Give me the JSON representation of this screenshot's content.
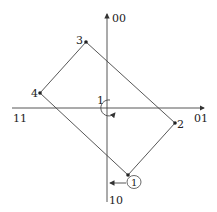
{
  "diagram": {
    "type": "constellation-rotation",
    "axes": {
      "top_label": "00",
      "right_label": "01",
      "left_label": "11",
      "bottom_label": "10"
    },
    "points": [
      {
        "id": "1",
        "label": "1",
        "circled": true
      },
      {
        "id": "2",
        "label": "2",
        "circled": false
      },
      {
        "id": "3",
        "label": "3",
        "circled": false
      },
      {
        "id": "4",
        "label": "4",
        "circled": false
      }
    ],
    "rotation_label": "1",
    "colors": {
      "line": "#444444",
      "text": "#222222",
      "background": "#ffffff"
    }
  }
}
